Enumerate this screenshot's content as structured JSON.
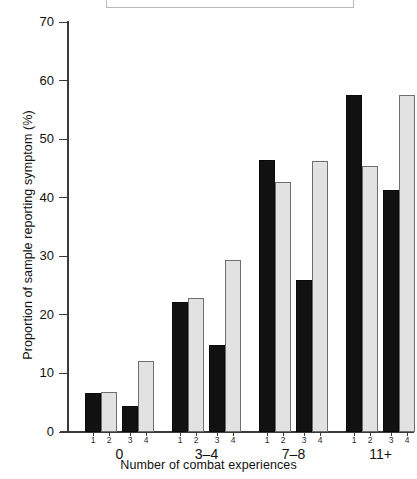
{
  "chart_data": {
    "type": "bar",
    "title": "",
    "subtitle": "",
    "xlabel": "Number of combat experiences",
    "ylabel": "Proportion of sample reporting symptom (%)",
    "categories": [
      "0",
      "3–4",
      "7–8",
      "11+"
    ],
    "series_labels": [
      "1",
      "2",
      "3",
      "4"
    ],
    "series": [
      {
        "name": "1",
        "values": [
          6.7,
          22.2,
          46.5,
          57.5
        ]
      },
      {
        "name": "2",
        "values": [
          6.9,
          22.8,
          42.6,
          45.5
        ]
      },
      {
        "name": "3",
        "values": [
          4.5,
          14.9,
          26.0,
          41.4
        ]
      },
      {
        "name": "4",
        "values": [
          12.2,
          29.4,
          46.3,
          57.5
        ]
      }
    ],
    "ylim": [
      0,
      70
    ],
    "yticks": [
      0,
      10,
      20,
      30,
      40,
      50,
      60,
      70
    ],
    "ytick_labels": [
      "0",
      "10",
      "20",
      "30",
      "40",
      "50",
      "60",
      "70"
    ],
    "grid": false,
    "legend_position": "none",
    "series_fills": [
      "dark",
      "light",
      "dark",
      "light"
    ],
    "colors": {
      "dark_bar": "#111111",
      "light_bar": "#e2e2e2",
      "light_bar_dots": "#8d8d8d",
      "axis": "#3a3a3a",
      "text": "#111111",
      "background": "#ffffff",
      "top_box_border": "#b9b9b9"
    }
  }
}
